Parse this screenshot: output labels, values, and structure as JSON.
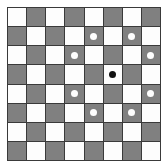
{
  "figure": {
    "type": "grid-pattern",
    "rows": 8,
    "columns": 8,
    "background_color": "#ffffff",
    "border_color": "#3a3a3a"
  },
  "colors": {
    "light_square": "#fdfdfd",
    "dark_square": "#808080",
    "grid_line": "#3a3a3a",
    "white_dot": "#fdfdfd",
    "black_dot": "#101010"
  },
  "legend": {
    "light_square_label": "light square",
    "dark_square_label": "dark square",
    "white_dot_label": "white marker dot",
    "black_dot_label": "black center dot"
  },
  "chart_data": {
    "type": "heatmap",
    "xlabel": "",
    "ylabel": "",
    "grid": true,
    "legend_position": "none",
    "categories": [
      "1",
      "2",
      "3",
      "4",
      "5",
      "6",
      "7",
      "8"
    ],
    "row_labels": [
      "1",
      "2",
      "3",
      "4",
      "5",
      "6",
      "7",
      "8"
    ],
    "squares": [
      [
        "light",
        "dark",
        "light",
        "dark",
        "light",
        "dark",
        "light",
        "dark"
      ],
      [
        "dark",
        "light",
        "dark",
        "light",
        "dark",
        "light",
        "dark",
        "light"
      ],
      [
        "light",
        "dark",
        "light",
        "dark",
        "light",
        "dark",
        "light",
        "dark"
      ],
      [
        "dark",
        "light",
        "dark",
        "light",
        "dark",
        "light",
        "dark",
        "light"
      ],
      [
        "light",
        "dark",
        "light",
        "dark",
        "light",
        "dark",
        "light",
        "dark"
      ],
      [
        "dark",
        "light",
        "dark",
        "light",
        "dark",
        "light",
        "dark",
        "light"
      ],
      [
        "light",
        "dark",
        "light",
        "dark",
        "light",
        "dark",
        "light",
        "dark"
      ],
      [
        "dark",
        "light",
        "dark",
        "light",
        "dark",
        "light",
        "dark",
        "light"
      ]
    ],
    "dots": [
      [
        null,
        null,
        null,
        null,
        null,
        null,
        null,
        null
      ],
      [
        null,
        null,
        null,
        null,
        "white",
        null,
        "white",
        null
      ],
      [
        null,
        null,
        null,
        "white",
        null,
        null,
        null,
        "white"
      ],
      [
        null,
        null,
        null,
        null,
        null,
        "black",
        null,
        null
      ],
      [
        null,
        null,
        null,
        "white",
        null,
        null,
        null,
        "white"
      ],
      [
        null,
        null,
        null,
        null,
        "white",
        null,
        "white",
        null
      ],
      [
        null,
        null,
        null,
        null,
        null,
        null,
        null,
        null
      ],
      [
        null,
        null,
        null,
        null,
        null,
        null,
        null,
        null
      ]
    ],
    "white_dot_positions": [
      {
        "row": 2,
        "col": 5
      },
      {
        "row": 2,
        "col": 7
      },
      {
        "row": 3,
        "col": 4
      },
      {
        "row": 3,
        "col": 8
      },
      {
        "row": 5,
        "col": 4
      },
      {
        "row": 5,
        "col": 8
      },
      {
        "row": 6,
        "col": 5
      },
      {
        "row": 6,
        "col": 7
      }
    ],
    "black_dot_positions": [
      {
        "row": 4,
        "col": 6
      }
    ],
    "white_dot_count": 8,
    "black_dot_count": 1,
    "total_squares": 64
  }
}
